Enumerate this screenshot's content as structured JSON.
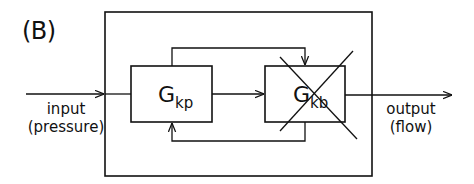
{
  "panel": {
    "label": "(B)"
  },
  "input": {
    "line1": "input",
    "line2": "(pressure)"
  },
  "output": {
    "line1": "output",
    "line2": "(flow)"
  },
  "blocks": [
    {
      "id": "kp",
      "main": "G",
      "sub": "kp",
      "crossed_out": false
    },
    {
      "id": "kb",
      "main": "G",
      "sub": "kb",
      "crossed_out": true
    }
  ],
  "colors": {
    "stroke": "#111111",
    "background": "#ffffff"
  }
}
